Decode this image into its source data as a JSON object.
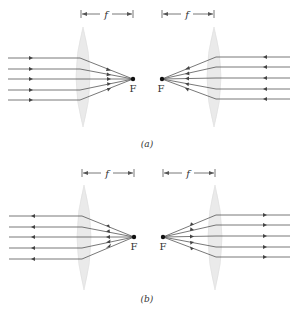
{
  "figure": {
    "colors": {
      "ray": "#555555",
      "lens_fill": "#e8e8e8",
      "lens_stroke": "#d8d8d8",
      "text": "#333333",
      "focal_point": "#111111"
    },
    "panels": [
      {
        "id": "a",
        "caption": "(a)",
        "left": {
          "focal_label": "F",
          "focal_length_label": "f",
          "direction": "rays travel left to right, converge to F"
        },
        "right": {
          "focal_label": "F",
          "focal_length_label": "f",
          "direction": "rays travel right to left, converge to F"
        }
      },
      {
        "id": "b",
        "caption": "(b)",
        "left": {
          "focal_label": "F",
          "focal_length_label": "f",
          "direction": "rays diverge from F, travel right to left"
        },
        "right": {
          "focal_label": "F",
          "focal_length_label": "f",
          "direction": "rays diverge from F, travel left to right"
        }
      }
    ]
  }
}
